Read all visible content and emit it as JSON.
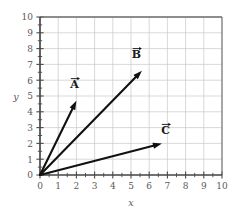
{
  "chart_data": {
    "type": "scatter",
    "title": "",
    "xlabel": "x",
    "ylabel": "y",
    "xlim": [
      0,
      10
    ],
    "ylim": [
      0,
      10
    ],
    "grid": true,
    "legend": "none",
    "xticks": [
      "0",
      "1",
      "2",
      "3",
      "4",
      "5",
      "6",
      "7",
      "8",
      "9",
      "10"
    ],
    "yticks": [
      "0",
      "1",
      "2",
      "3",
      "4",
      "5",
      "6",
      "7",
      "8",
      "9",
      "10"
    ],
    "minor_tick_step": 0.5,
    "vectors": [
      {
        "name": "A",
        "label": "A",
        "tail": [
          0,
          0
        ],
        "tip": [
          2.0,
          4.7
        ],
        "label_pos": [
          1.9,
          5.5
        ]
      },
      {
        "name": "B",
        "label": "B",
        "tail": [
          0,
          0
        ],
        "tip": [
          5.6,
          6.6
        ],
        "label_pos": [
          5.3,
          7.4
        ]
      },
      {
        "name": "C",
        "label": "C",
        "tail": [
          0,
          0
        ],
        "tip": [
          6.7,
          2.0
        ],
        "label_pos": [
          6.9,
          2.6
        ]
      }
    ]
  },
  "style": {
    "background": "#ffffff",
    "grid_color": "#c8c8c8",
    "axis_color": "#4a4a4a",
    "frame_color": "#6e6e6e",
    "vector_color": "#111111",
    "label_color": "#5a5a5a"
  },
  "axis_labels": {
    "x": "x",
    "y": "y"
  }
}
